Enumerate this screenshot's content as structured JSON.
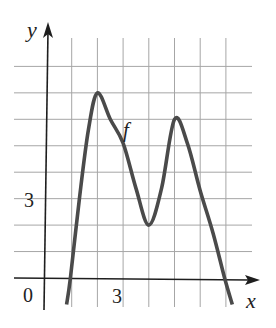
{
  "chart_data": {
    "type": "line",
    "title": "",
    "xlabel": "x",
    "ylabel": "y",
    "origin_label": "0",
    "x_tick_labels": [
      {
        "value": 3,
        "label": "3"
      }
    ],
    "y_tick_labels": [
      {
        "value": 3,
        "label": "3"
      }
    ],
    "grid": true,
    "grid_x": [
      1,
      2,
      3,
      4,
      5,
      6,
      7
    ],
    "grid_y": [
      1,
      2,
      3,
      4,
      5,
      6,
      7,
      8
    ],
    "xlim": [
      -1.2,
      8.3
    ],
    "ylim": [
      -1.1,
      9.4
    ],
    "series": [
      {
        "name": "f",
        "label": "f",
        "points": [
          [
            0.8,
            -1.0
          ],
          [
            0.95,
            0.0
          ],
          [
            1.3,
            3.0
          ],
          [
            1.65,
            5.6
          ],
          [
            2.0,
            7.0
          ],
          [
            2.5,
            6.0
          ],
          [
            3.0,
            5.1
          ],
          [
            3.5,
            3.4
          ],
          [
            4.0,
            2.0
          ],
          [
            4.5,
            3.4
          ],
          [
            5.0,
            6.0
          ],
          [
            5.5,
            5.1
          ],
          [
            6.0,
            3.3
          ],
          [
            6.5,
            1.7
          ],
          [
            6.95,
            0.0
          ],
          [
            7.25,
            -1.0
          ]
        ],
        "extrema": {
          "local_max": [
            [
              2,
              7
            ],
            [
              5,
              6
            ]
          ],
          "local_min": [
            [
              4,
              2
            ]
          ]
        },
        "x_intercepts": [
          0.95,
          6.95
        ]
      }
    ]
  },
  "labels": {
    "y_axis": "y",
    "x_axis": "x",
    "curve": "f",
    "origin": "0",
    "y_tick": "3",
    "x_tick": "3"
  },
  "colors": {
    "curve": "#4a4a4a",
    "axis": "#1e1e1e",
    "grid": "#a6a6a6",
    "text": "#222222"
  }
}
